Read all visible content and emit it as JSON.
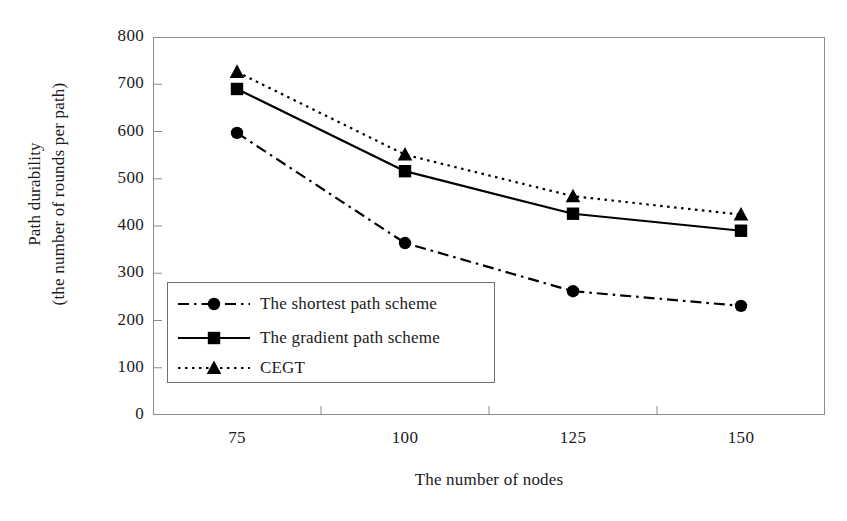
{
  "chart_data": {
    "type": "line",
    "title": "",
    "xlabel": "The number of nodes",
    "ylabel": "Path durability (the number of rounds per path)",
    "ylabel_line1": "Path durability",
    "ylabel_line2": "(the number of rounds per path)",
    "categories": [
      "75",
      "100",
      "125",
      "150"
    ],
    "x": [
      75,
      100,
      125,
      150
    ],
    "ylim": [
      0,
      800
    ],
    "yticks": [
      "800",
      "700",
      "600",
      "500",
      "400",
      "300",
      "200",
      "100",
      "0"
    ],
    "ytick_values": [
      800,
      700,
      600,
      500,
      400,
      300,
      200,
      100,
      0
    ],
    "grid": false,
    "legend_position": "inside-lower-left",
    "series": [
      {
        "name": "The shortest path scheme",
        "marker": "circle",
        "linestyle": "dashdot",
        "color": "#000000",
        "values": [
          597,
          364,
          262,
          231
        ]
      },
      {
        "name": "The gradient path scheme",
        "marker": "square",
        "linestyle": "solid",
        "color": "#000000",
        "values": [
          690,
          516,
          426,
          390
        ]
      },
      {
        "name": "CEGT",
        "marker": "triangle",
        "linestyle": "dotted",
        "color": "#000000",
        "values": [
          726,
          551,
          463,
          424
        ]
      }
    ]
  },
  "legend": {
    "items": [
      {
        "label": "The shortest path scheme",
        "marker": "circle",
        "linestyle": "dashdot"
      },
      {
        "label": "The gradient path scheme",
        "marker": "square",
        "linestyle": "solid"
      },
      {
        "label": "CEGT",
        "marker": "triangle",
        "linestyle": "dotted"
      }
    ]
  },
  "colors": {
    "ink": "#000000",
    "axis": "#8d8d8d",
    "legend_border": "#6f6f6f",
    "background": "#ffffff"
  }
}
